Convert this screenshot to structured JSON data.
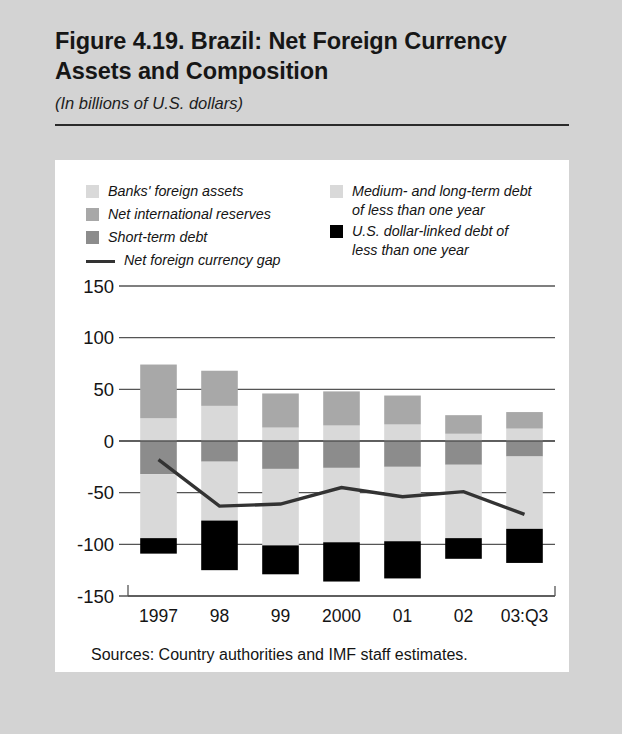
{
  "figure": {
    "title": "Figure 4.19. Brazil: Net Foreign Currency Assets and Composition",
    "subtitle": "(In billions of U.S. dollars)",
    "source": "Sources: Country authorities and IMF staff estimates."
  },
  "colors": {
    "page_background": "#d3d3d3",
    "panel_background": "#ffffff",
    "banks_foreign_assets": "#d9d9d9",
    "net_international_reserves": "#a8a8a8",
    "short_term_debt": "#8c8c8c",
    "medium_long_term_debt": "#d9d9d9",
    "usd_linked_debt": "#000000",
    "net_foreign_currency_gap_line": "#333333",
    "axis": "#555555",
    "text": "#141414"
  },
  "legend": {
    "left": [
      {
        "label": "Banks' foreign assets",
        "type": "swatch",
        "color": "#d9d9d9",
        "key": "banks_foreign_assets"
      },
      {
        "label": "Net international reserves",
        "type": "swatch",
        "color": "#a8a8a8",
        "key": "net_international_reserves"
      },
      {
        "label": "Short-term debt",
        "type": "swatch",
        "color": "#8c8c8c",
        "key": "short_term_debt"
      },
      {
        "label": "Net foreign currency gap",
        "type": "line",
        "color": "#333333",
        "key": "net_foreign_currency_gap"
      }
    ],
    "right": [
      {
        "label": "Medium- and long-term debt\n  of less than one year",
        "type": "swatch",
        "color": "#d9d9d9",
        "key": "medium_long_term_debt"
      },
      {
        "label": "U.S. dollar-linked debt of\n  less than one year",
        "type": "swatch",
        "color": "#000000",
        "key": "usd_linked_debt"
      }
    ]
  },
  "chart_data": {
    "type": "bar",
    "subtype": "stacked-bar-with-line",
    "title": "Figure 4.19. Brazil: Net Foreign Currency Assets and Composition",
    "subtitle": "(In billions of U.S. dollars)",
    "xlabel": "",
    "ylabel": "",
    "ylim": [
      -150,
      150
    ],
    "yticks": [
      150,
      100,
      50,
      0,
      -50,
      -100,
      -150
    ],
    "ytick_labels": [
      "150",
      "100",
      "50",
      "0",
      "-50",
      "-100",
      "-150"
    ],
    "grid": true,
    "legend_position": "top",
    "categories": [
      "1997",
      "98",
      "99",
      "2000",
      "01",
      "02",
      "03:Q3"
    ],
    "series": [
      {
        "name": "Banks' foreign assets",
        "color": "#d9d9d9",
        "stack": "positive",
        "values": [
          22,
          34,
          13,
          15,
          16,
          7,
          12
        ]
      },
      {
        "name": "Net international reserves",
        "color": "#a8a8a8",
        "stack": "positive",
        "values": [
          52,
          34,
          33,
          33,
          28,
          18,
          16
        ]
      },
      {
        "name": "Short-term debt",
        "color": "#8c8c8c",
        "stack": "negative",
        "values": [
          -32,
          -20,
          -27,
          -26,
          -25,
          -23,
          -15
        ]
      },
      {
        "name": "Medium- and long-term debt of less than one year",
        "color": "#d9d9d9",
        "stack": "negative",
        "values": [
          -62,
          -57,
          -74,
          -72,
          -72,
          -71,
          -70
        ]
      },
      {
        "name": "U.S. dollar-linked debt of less than one year",
        "color": "#000000",
        "stack": "negative",
        "values": [
          -15,
          -48,
          -28,
          -38,
          -36,
          -20,
          -33
        ]
      }
    ],
    "line_series": {
      "name": "Net foreign currency gap",
      "color": "#333333",
      "values": [
        -18,
        -63,
        -61,
        -45,
        -54,
        -49,
        -71
      ]
    }
  },
  "source_note": "Sources: Country authorities and IMF staff estimates."
}
